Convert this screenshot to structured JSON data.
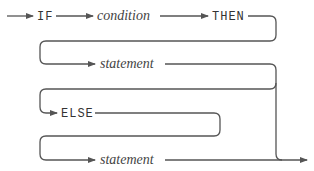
{
  "diagram": {
    "type": "syntax-railroad",
    "nodes": [
      {
        "id": "kw_if",
        "label": "IF",
        "kind": "keyword"
      },
      {
        "id": "condition",
        "label": "condition",
        "kind": "nonterminal"
      },
      {
        "id": "kw_then",
        "label": "THEN",
        "kind": "keyword"
      },
      {
        "id": "statement1",
        "label": "statement",
        "kind": "nonterminal"
      },
      {
        "id": "kw_else",
        "label": "ELSE",
        "kind": "keyword"
      },
      {
        "id": "statement2",
        "label": "statement",
        "kind": "nonterminal"
      }
    ],
    "edges": [
      {
        "from": "start",
        "to": "kw_if"
      },
      {
        "from": "kw_if",
        "to": "condition"
      },
      {
        "from": "condition",
        "to": "kw_then"
      },
      {
        "from": "kw_then",
        "to": "statement1"
      },
      {
        "from": "statement1",
        "to": "end"
      },
      {
        "from": "statement1",
        "to": "kw_else"
      },
      {
        "from": "kw_else",
        "to": "statement2"
      },
      {
        "from": "statement2",
        "to": "end"
      }
    ],
    "colors": {
      "line": "#555555",
      "text": "#333333"
    }
  }
}
